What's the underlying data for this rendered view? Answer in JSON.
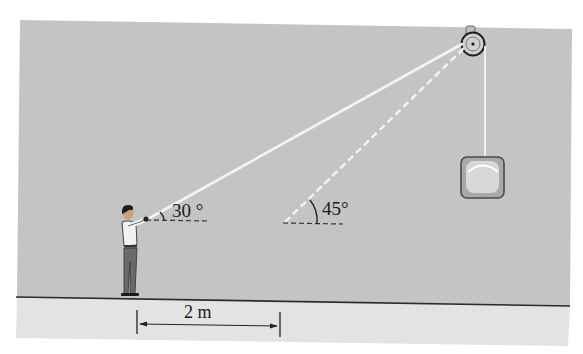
{
  "figure": {
    "type": "physics-pulley-diagram",
    "colors": {
      "wall": "#c4c4c4",
      "floor": "#e4e4e4",
      "page": "#ffffff",
      "rope": "#f2f2f2",
      "ink": "#1a1a1a"
    },
    "labels": {
      "angle_initial": "30 °",
      "angle_final": "45°",
      "distance": "2 m"
    },
    "elements": {
      "person": "man pulling rope",
      "pulley": "ceiling pulley",
      "weight": "hanging block"
    }
  }
}
